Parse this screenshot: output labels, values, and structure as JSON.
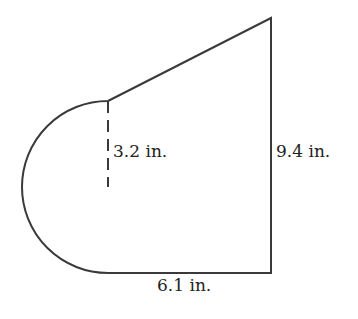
{
  "diagram": {
    "type": "composite-figure",
    "shapes": [
      {
        "name": "semicircle",
        "diameter_label": "3.2 in.",
        "note": "dashed segment marks the radius"
      },
      {
        "name": "trapezoid",
        "right_side": "9.4 in.",
        "bottom_side": "6.1 in."
      }
    ],
    "labels": {
      "radius": "3.2 in.",
      "height": "9.4 in.",
      "base": "6.1 in."
    },
    "colors": {
      "stroke": "#3a3a3a",
      "text": "#222222",
      "background": "#ffffff"
    }
  }
}
